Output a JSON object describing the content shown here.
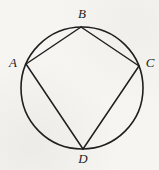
{
  "diagram": {
    "background": "#f6f5f2",
    "stroke_color": "#1f1f1f",
    "circle_stroke_width": 1.6,
    "chord_stroke_width": 1.5,
    "circle": {
      "cx": 82,
      "cy": 88,
      "r": 61
    },
    "vertices": [
      {
        "label": "A",
        "x": 26,
        "y": 64,
        "label_x": 13,
        "label_y": 62
      },
      {
        "label": "B",
        "x": 81,
        "y": 27,
        "label_x": 82,
        "label_y": 13
      },
      {
        "label": "C",
        "x": 139,
        "y": 66,
        "label_x": 150,
        "label_y": 62
      },
      {
        "label": "D",
        "x": 83,
        "y": 149,
        "label_x": 83,
        "label_y": 158
      }
    ],
    "edges": [
      [
        "A",
        "B"
      ],
      [
        "B",
        "C"
      ],
      [
        "C",
        "D"
      ],
      [
        "D",
        "A"
      ]
    ]
  }
}
